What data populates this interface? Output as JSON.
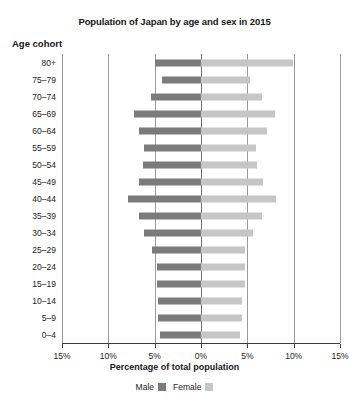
{
  "chart_data": {
    "type": "bar",
    "subtype": "population-pyramid",
    "title": "Population of Japan by age and sex in 2015",
    "xlabel": "Percentage of total population",
    "ylabel": "Age cohort",
    "grid": true,
    "legend_position": "bottom",
    "xlim": [
      -15,
      15
    ],
    "xticks": [
      -15,
      -10,
      -5,
      0,
      5,
      10,
      15
    ],
    "xtick_labels": [
      "15%",
      "10%",
      "5%",
      "0%",
      "5%",
      "10%",
      "15%"
    ],
    "categories": [
      "80+",
      "75–79",
      "70–74",
      "65–69",
      "60–64",
      "55–59",
      "50–54",
      "45–49",
      "40–44",
      "35–39",
      "30–34",
      "25–29",
      "20–24",
      "15–19",
      "10–14",
      "5–9",
      "0–4"
    ],
    "series": [
      {
        "name": "Male",
        "color": "#7b7b7b",
        "direction": "left",
        "values": [
          5.0,
          4.2,
          5.4,
          7.2,
          6.7,
          6.2,
          6.3,
          6.7,
          7.9,
          6.7,
          6.2,
          5.3,
          4.8,
          4.8,
          4.6,
          4.6,
          4.4
        ]
      },
      {
        "name": "Female",
        "color": "#c6c6c6",
        "direction": "right",
        "values": [
          9.9,
          5.3,
          6.6,
          8.0,
          7.1,
          5.9,
          6.0,
          6.7,
          8.1,
          6.6,
          5.6,
          4.8,
          4.8,
          4.7,
          4.4,
          4.4,
          4.2
        ]
      }
    ]
  },
  "legend": {
    "items": [
      {
        "label": "Male",
        "color": "#7b7b7b"
      },
      {
        "label": "Female",
        "color": "#c6c6c6"
      }
    ]
  }
}
